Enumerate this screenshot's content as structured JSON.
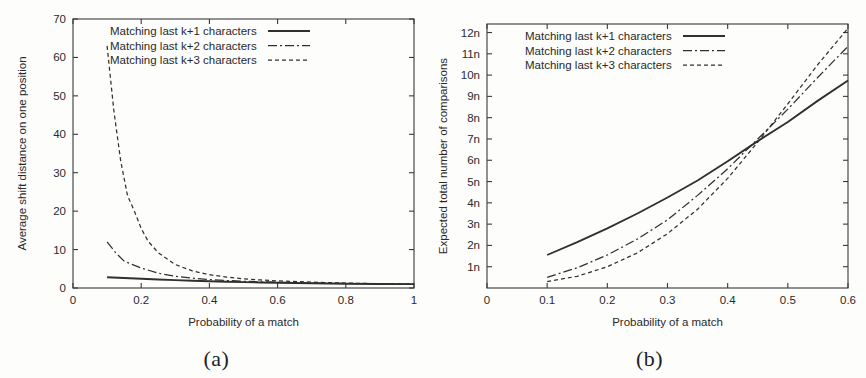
{
  "figure": {
    "panels": [
      {
        "caption": "(a)",
        "chart_data": {
          "type": "line",
          "title": "",
          "xlabel": "Probability of a match",
          "ylabel": "Average shift distance on one position",
          "xlim": [
            0,
            1
          ],
          "ylim": [
            0,
            70
          ],
          "xticks": [
            0,
            0.2,
            0.4,
            0.6,
            0.8,
            1
          ],
          "xticklabels": [
            "0",
            "0.2",
            "0.4",
            "0.6",
            "0.8",
            "1"
          ],
          "yticks": [
            0,
            10,
            20,
            30,
            40,
            50,
            60,
            70
          ],
          "yticklabels": [
            "0",
            "10",
            "20",
            "30",
            "40",
            "50",
            "60",
            "70"
          ],
          "grid": false,
          "legend_position": "top-center",
          "series": [
            {
              "name": "Matching last k+1 characters",
              "style": "solid",
              "x": [
                0.1,
                0.15,
                0.2,
                0.25,
                0.3,
                0.35,
                0.4,
                0.45,
                0.5,
                0.55,
                0.6,
                0.7,
                0.8,
                0.9,
                1.0
              ],
              "y": [
                2.8,
                2.6,
                2.4,
                2.22,
                2.05,
                1.9,
                1.76,
                1.64,
                1.53,
                1.44,
                1.36,
                1.22,
                1.12,
                1.05,
                1.0
              ]
            },
            {
              "name": "Matching last k+2 characters",
              "style": "dashdot",
              "x": [
                0.1,
                0.125,
                0.15,
                0.175,
                0.2,
                0.25,
                0.3,
                0.35,
                0.4,
                0.45,
                0.5,
                0.55,
                0.6,
                0.7,
                0.8,
                0.9,
                1.0
              ],
              "y": [
                12.0,
                9.2,
                7.0,
                6.1,
                5.2,
                3.85,
                3.05,
                2.55,
                2.2,
                1.95,
                1.76,
                1.6,
                1.48,
                1.3,
                1.17,
                1.07,
                1.0
              ]
            },
            {
              "name": "Matching last k+3 characters",
              "style": "dotted",
              "x": [
                0.1,
                0.12,
                0.14,
                0.16,
                0.18,
                0.2,
                0.22,
                0.25,
                0.3,
                0.35,
                0.4,
                0.45,
                0.5,
                0.55,
                0.6,
                0.7,
                0.8,
                0.9,
                1.0
              ],
              "y": [
                63.0,
                46.0,
                33.0,
                24.0,
                20.0,
                15.5,
                12.2,
                9.2,
                6.1,
                4.45,
                3.45,
                2.85,
                2.4,
                2.1,
                1.85,
                1.52,
                1.28,
                1.12,
                1.0
              ]
            }
          ]
        }
      },
      {
        "caption": "(b)",
        "chart_data": {
          "type": "line",
          "title": "",
          "xlabel": "Probability of a match",
          "ylabel": "Expected total number of comparisons",
          "xlim": [
            0,
            0.6
          ],
          "ylim": [
            0,
            12.4
          ],
          "xticks": [
            0,
            0.1,
            0.2,
            0.3,
            0.4,
            0.5,
            0.6
          ],
          "xticklabels": [
            "0",
            "0.1",
            "0.2",
            "0.3",
            "0.4",
            "0.5",
            "0.6"
          ],
          "yticks": [
            1,
            2,
            3,
            4,
            5,
            6,
            7,
            8,
            9,
            10,
            11,
            12
          ],
          "yticklabels": [
            "1n",
            "2n",
            "3n",
            "4n",
            "5n",
            "6n",
            "7n",
            "8n",
            "9n",
            "10n",
            "11n",
            "12n"
          ],
          "grid": false,
          "legend_position": "top-center",
          "series": [
            {
              "name": "Matching last k+1 characters",
              "style": "solid",
              "x": [
                0.1,
                0.15,
                0.2,
                0.25,
                0.3,
                0.35,
                0.4,
                0.45,
                0.5,
                0.55,
                0.6
              ],
              "y": [
                1.55,
                2.15,
                2.8,
                3.5,
                4.25,
                5.05,
                5.95,
                6.9,
                7.8,
                8.8,
                9.75
              ]
            },
            {
              "name": "Matching last k+2 characters",
              "style": "dashdot",
              "x": [
                0.1,
                0.15,
                0.2,
                0.25,
                0.3,
                0.35,
                0.4,
                0.45,
                0.5,
                0.55,
                0.6
              ],
              "y": [
                0.5,
                0.95,
                1.55,
                2.3,
                3.2,
                4.35,
                5.6,
                7.0,
                8.4,
                9.9,
                11.35
              ]
            },
            {
              "name": "Matching last k+3 characters",
              "style": "dotted",
              "x": [
                0.1,
                0.15,
                0.2,
                0.25,
                0.3,
                0.35,
                0.4,
                0.45,
                0.5,
                0.55,
                0.6
              ],
              "y": [
                0.3,
                0.55,
                1.0,
                1.65,
                2.55,
                3.7,
                5.15,
                6.85,
                8.65,
                10.5,
                12.2
              ]
            }
          ]
        }
      }
    ]
  }
}
